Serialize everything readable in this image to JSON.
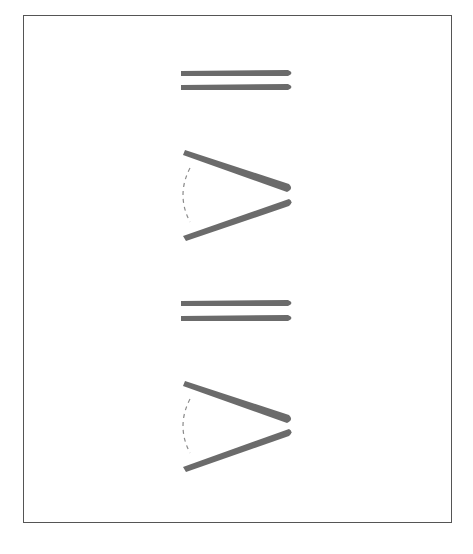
{
  "diagram": {
    "colors": {
      "stroke": "#6b6b6b",
      "dash": "#8a8a8a",
      "border": "#555555"
    },
    "figures": [
      {
        "type": "parallel-lines",
        "y1": 73,
        "y2": 87
      },
      {
        "type": "angle",
        "top_start": [
          186,
          153
        ],
        "tip_top": [
          288,
          188
        ],
        "tip_bottom": [
          288,
          203
        ],
        "bottom_end": [
          186,
          238
        ],
        "arc": true
      },
      {
        "type": "parallel-lines",
        "y1": 303,
        "y2": 318
      },
      {
        "type": "angle",
        "top_start": [
          186,
          384
        ],
        "tip_top": [
          288,
          419
        ],
        "tip_bottom": [
          288,
          433
        ],
        "bottom_end": [
          186,
          469
        ],
        "arc": true
      }
    ]
  }
}
